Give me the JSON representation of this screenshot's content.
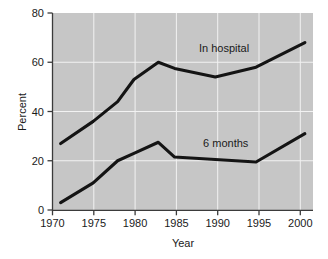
{
  "chart_data": {
    "type": "line",
    "title": "",
    "xlabel": "Year",
    "ylabel": "Percent",
    "xlim": [
      1970,
      2002
    ],
    "ylim": [
      0,
      80
    ],
    "grid": true,
    "legend_position": "inline-annotations",
    "xticks": [
      1970,
      1975,
      1980,
      1985,
      1990,
      1995,
      2000
    ],
    "xtick_labels": [
      "1970",
      "1975",
      "1980",
      "1985",
      "1990",
      "1995",
      "2000"
    ],
    "yticks": [
      0,
      20,
      40,
      60,
      80
    ],
    "ytick_labels": [
      "0",
      "20",
      "40",
      "60",
      "80"
    ],
    "series": [
      {
        "name": "In hospital",
        "label_text": "In hospital",
        "color": "#141414",
        "x": [
          1971,
          1975,
          1978,
          1980,
          1983,
          1985,
          1990,
          1995,
          2001
        ],
        "values": [
          27,
          36,
          44,
          53,
          60,
          57.5,
          54,
          58,
          68
        ]
      },
      {
        "name": "6 months",
        "label_text": "6 months",
        "color": "#141414",
        "x": [
          1971,
          1975,
          1978,
          1980,
          1983,
          1985,
          1990,
          1995,
          2001
        ],
        "values": [
          3,
          11,
          20,
          23,
          27.5,
          21.5,
          20.5,
          19.5,
          31
        ]
      }
    ],
    "annotations": [
      {
        "text": "In hospital",
        "x": 1988,
        "y": 64
      },
      {
        "text": "6 months",
        "x": 1988.5,
        "y": 25.5
      }
    ],
    "plot_background_color": "#c6c6c6",
    "gridline_color": "#f2f2f2",
    "axis_color": "#3b3b3b"
  }
}
